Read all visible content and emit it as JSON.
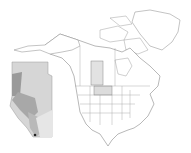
{
  "map": {
    "subject": "North America range map",
    "highlighted_regions": [
      "Alberta",
      "Montana"
    ],
    "inset_region": "Alberta",
    "colors": {
      "background": "#ffffff",
      "outline": "#8a8a8a",
      "highlight_fill": "#dcdcdc",
      "inset_light": "#d9d9d9",
      "inset_mid": "#b5b5b5",
      "inset_dark": "#8f8f8f"
    }
  }
}
